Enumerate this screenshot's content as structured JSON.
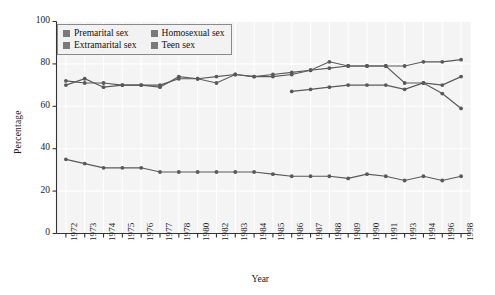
{
  "chart": {
    "type": "line",
    "xlabel": "Year",
    "ylabel": "Percentage",
    "y_ticks": [
      "0",
      "20",
      "40",
      "60",
      "80",
      "100"
    ],
    "legend_position": "top-left",
    "grid": true,
    "plot_bg": "#f4f4f4",
    "grid_color": "#ffffff",
    "line_color": "#595959",
    "swatch_color": "#7a7a7a"
  },
  "chart_data": {
    "type": "line",
    "title": "",
    "xlabel": "Year",
    "ylabel": "Percentage",
    "ylim": [
      0,
      100
    ],
    "yticks": [
      0,
      20,
      40,
      60,
      80,
      100
    ],
    "grid": true,
    "legend_position": "top-left",
    "categories": [
      "1972",
      "1973",
      "1974",
      "1975",
      "1976",
      "1977",
      "1978",
      "1980",
      "1982",
      "1983",
      "1984",
      "1985",
      "1986",
      "1987",
      "1988",
      "1989",
      "1990",
      "1991",
      "1993",
      "1994",
      "1996",
      "1998"
    ],
    "series": [
      {
        "name": "Premarital sex",
        "values": [
          70,
          73,
          69,
          70,
          70,
          69,
          74,
          73,
          71,
          75,
          74,
          75,
          76,
          77,
          81,
          79,
          79,
          79,
          79,
          81,
          81,
          82
        ]
      },
      {
        "name": "Extramarital sex",
        "values": [
          35,
          33,
          31,
          31,
          31,
          29,
          29,
          29,
          29,
          29,
          29,
          28,
          27,
          27,
          27,
          26,
          28,
          27,
          25,
          27,
          25,
          27
        ]
      },
      {
        "name": "Homosexual sex",
        "values": [
          72,
          71,
          71,
          70,
          70,
          70,
          73,
          73,
          74,
          75,
          74,
          74,
          75,
          77,
          78,
          79,
          79,
          79,
          71,
          71,
          66,
          59
        ]
      },
      {
        "name": "Teen sex",
        "values": [
          null,
          null,
          null,
          null,
          null,
          null,
          null,
          null,
          null,
          null,
          null,
          null,
          67,
          68,
          69,
          70,
          70,
          70,
          68,
          71,
          70,
          74
        ]
      }
    ]
  },
  "legend": {
    "items": [
      {
        "label": "Premarital sex"
      },
      {
        "label": "Homosexual sex"
      },
      {
        "label": "Extramarital sex"
      },
      {
        "label": "Teen sex"
      }
    ]
  }
}
